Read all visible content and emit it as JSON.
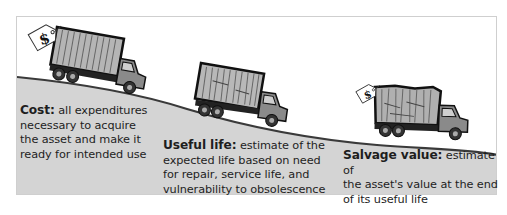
{
  "diagram": {
    "stages": [
      {
        "id": "cost",
        "term": "Cost:",
        "definition": "all expenditures necessary to acquire the asset and make it ready for intended use",
        "lines": [
          "all expenditures",
          "necessary to acquire",
          "the asset and make it",
          "ready for intended use"
        ],
        "price_tag": "$",
        "truck_condition": "new"
      },
      {
        "id": "useful-life",
        "term": "Useful life:",
        "definition": "estimate of the expected life based on need for repair, service life, and vulnerability to obsolescence",
        "lines": [
          "estimate of the",
          "expected life based on need",
          "for repair, service life, and",
          "vulnerability to obsolescence"
        ],
        "truck_condition": "used"
      },
      {
        "id": "salvage",
        "term": "Salvage value:",
        "definition": "estimate of the asset's value at the end of its useful life",
        "lines": [
          "estimate of",
          "the asset's value at the end",
          "of its useful life"
        ],
        "price_tag": "$",
        "truck_condition": "worn"
      }
    ]
  },
  "colors": {
    "hill_fill": "#d4d4d4",
    "hill_edge": "#3a3a3a",
    "truck_body": "#8a8a8a",
    "cargo_box": "#b5b5b5",
    "outline": "#111111",
    "frame_border": "#cfcfcf"
  }
}
